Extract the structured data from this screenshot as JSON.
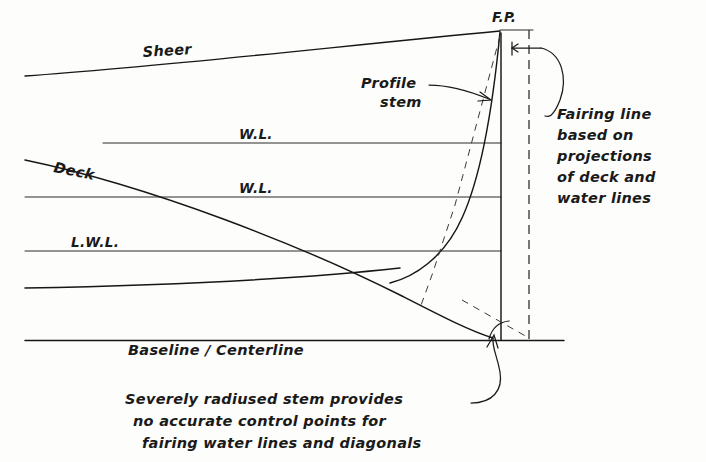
{
  "figure": {
    "background_color": "#fdfdfc",
    "ink_color": "#161616"
  },
  "labels": {
    "sheer": "Sheer",
    "deck": "Deck",
    "waterline_upper": "W.L.",
    "waterline_lower": "W.L.",
    "lwl": "L.W.L.",
    "baseline": "Baseline / Centerline",
    "fp": "F.P.",
    "profile_stem_line1": "Profile",
    "profile_stem_line2": "stem"
  },
  "callouts": {
    "fairing": {
      "lines": [
        "Fairing line",
        "based on",
        "projections",
        "of deck and",
        "water lines"
      ]
    },
    "stem_note": {
      "lines": [
        "Severely radiused stem provides",
        "no accurate control points for",
        "fairing  water lines and diagonals"
      ]
    }
  },
  "geometry": {
    "baseline_y": 340,
    "waterlines_y": [
      143,
      197,
      251,
      285
    ],
    "fp_x": 501,
    "fairing_dash_x": 529,
    "left_margin_x": 25
  }
}
